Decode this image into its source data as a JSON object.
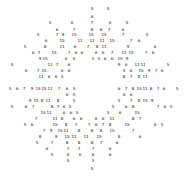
{
  "chart_data": {
    "type": "scatter",
    "title": "",
    "subtitle": "",
    "xlabel": "",
    "ylabel": "",
    "legend": [],
    "legend_position": "none",
    "grid": false,
    "axes_visible": false,
    "tick_labels_x": [],
    "tick_labels_y": [],
    "xlim": [
      0,
      185
    ],
    "ylim": [
      0,
      180
    ],
    "marker_style": "text-number",
    "marker_color": "#111111",
    "background_color": "#ffffff",
    "shape": "annulus",
    "center": [
      92,
      90
    ],
    "inner_radius": 26,
    "outer_radius": 90,
    "value_range": [
      3,
      15
    ],
    "point_count": 268,
    "points": [
      {
        "x": 92,
        "y": 9,
        "v": "5"
      },
      {
        "x": 108,
        "y": 9,
        "v": "5"
      },
      {
        "x": 92,
        "y": 17,
        "v": "6"
      },
      {
        "x": 50,
        "y": 23,
        "v": "5"
      },
      {
        "x": 72,
        "y": 23,
        "v": "6"
      },
      {
        "x": 92,
        "y": 23,
        "v": "7"
      },
      {
        "x": 110,
        "y": 23,
        "v": "6"
      },
      {
        "x": 127,
        "y": 23,
        "v": "5"
      },
      {
        "x": 57,
        "y": 30,
        "v": "6"
      },
      {
        "x": 74,
        "y": 30,
        "v": "7"
      },
      {
        "x": 92,
        "y": 30,
        "v": "8"
      },
      {
        "x": 101,
        "y": 30,
        "v": "8"
      },
      {
        "x": 109,
        "y": 30,
        "v": "7"
      },
      {
        "x": 123,
        "y": 30,
        "v": "6"
      },
      {
        "x": 38,
        "y": 35,
        "v": "5"
      },
      {
        "x": 57,
        "y": 35,
        "v": "7"
      },
      {
        "x": 63,
        "y": 35,
        "v": "9"
      },
      {
        "x": 74,
        "y": 35,
        "v": "15"
      },
      {
        "x": 91,
        "y": 35,
        "v": "15"
      },
      {
        "x": 104,
        "y": 35,
        "v": "15"
      },
      {
        "x": 123,
        "y": 35,
        "v": "7"
      },
      {
        "x": 147,
        "y": 35,
        "v": "5"
      },
      {
        "x": 46,
        "y": 41,
        "v": "6"
      },
      {
        "x": 62,
        "y": 41,
        "v": "15"
      },
      {
        "x": 80,
        "y": 41,
        "v": "11"
      },
      {
        "x": 92,
        "y": 41,
        "v": "11"
      },
      {
        "x": 102,
        "y": 41,
        "v": "11"
      },
      {
        "x": 112,
        "y": 41,
        "v": "15"
      },
      {
        "x": 131,
        "y": 41,
        "v": "7"
      },
      {
        "x": 139,
        "y": 41,
        "v": "6"
      },
      {
        "x": 25,
        "y": 47,
        "v": "5"
      },
      {
        "x": 45,
        "y": 47,
        "v": "8"
      },
      {
        "x": 62,
        "y": 47,
        "v": "11"
      },
      {
        "x": 75,
        "y": 47,
        "v": "6"
      },
      {
        "x": 88,
        "y": 47,
        "v": "7"
      },
      {
        "x": 97,
        "y": 47,
        "v": "8"
      },
      {
        "x": 104,
        "y": 47,
        "v": "11"
      },
      {
        "x": 128,
        "y": 47,
        "v": "9"
      },
      {
        "x": 155,
        "y": 47,
        "v": "6"
      },
      {
        "x": 33,
        "y": 53,
        "v": "6"
      },
      {
        "x": 39,
        "y": 53,
        "v": "7"
      },
      {
        "x": 54,
        "y": 53,
        "v": "15"
      },
      {
        "x": 69,
        "y": 53,
        "v": "7"
      },
      {
        "x": 76,
        "y": 53,
        "v": "6"
      },
      {
        "x": 82,
        "y": 53,
        "v": "6"
      },
      {
        "x": 96,
        "y": 53,
        "v": "6"
      },
      {
        "x": 103,
        "y": 53,
        "v": "6"
      },
      {
        "x": 112,
        "y": 53,
        "v": "7"
      },
      {
        "x": 124,
        "y": 53,
        "v": "11"
      },
      {
        "x": 131,
        "y": 53,
        "v": "15"
      },
      {
        "x": 146,
        "y": 53,
        "v": "7"
      },
      {
        "x": 153,
        "y": 53,
        "v": "6"
      },
      {
        "x": 40,
        "y": 59,
        "v": "9"
      },
      {
        "x": 45,
        "y": 59,
        "v": "15"
      },
      {
        "x": 66,
        "y": 59,
        "v": "6"
      },
      {
        "x": 74,
        "y": 59,
        "v": "5"
      },
      {
        "x": 93,
        "y": 59,
        "v": "5"
      },
      {
        "x": 99,
        "y": 59,
        "v": "5"
      },
      {
        "x": 105,
        "y": 59,
        "v": "6"
      },
      {
        "x": 112,
        "y": 59,
        "v": "6"
      },
      {
        "x": 120,
        "y": 59,
        "v": "15"
      },
      {
        "x": 127,
        "y": 59,
        "v": "9"
      },
      {
        "x": 12,
        "y": 65,
        "v": "5"
      },
      {
        "x": 50,
        "y": 65,
        "v": "11"
      },
      {
        "x": 57,
        "y": 65,
        "v": "7"
      },
      {
        "x": 69,
        "y": 65,
        "v": "6"
      },
      {
        "x": 119,
        "y": 65,
        "v": "9"
      },
      {
        "x": 126,
        "y": 65,
        "v": "6"
      },
      {
        "x": 137,
        "y": 65,
        "v": "11"
      },
      {
        "x": 143,
        "y": 65,
        "v": "11"
      },
      {
        "x": 168,
        "y": 65,
        "v": "5"
      },
      {
        "x": 26,
        "y": 71,
        "v": "6"
      },
      {
        "x": 38,
        "y": 71,
        "v": "7"
      },
      {
        "x": 44,
        "y": 71,
        "v": "15"
      },
      {
        "x": 62,
        "y": 71,
        "v": "6"
      },
      {
        "x": 69,
        "y": 71,
        "v": "6"
      },
      {
        "x": 124,
        "y": 71,
        "v": "5"
      },
      {
        "x": 131,
        "y": 71,
        "v": "6"
      },
      {
        "x": 141,
        "y": 71,
        "v": "15"
      },
      {
        "x": 149,
        "y": 71,
        "v": "9"
      },
      {
        "x": 156,
        "y": 71,
        "v": "7"
      },
      {
        "x": 162,
        "y": 71,
        "v": "6"
      },
      {
        "x": 41,
        "y": 77,
        "v": "11"
      },
      {
        "x": 49,
        "y": 77,
        "v": "6"
      },
      {
        "x": 56,
        "y": 77,
        "v": "6"
      },
      {
        "x": 62,
        "y": 77,
        "v": "5"
      },
      {
        "x": 124,
        "y": 77,
        "v": "8"
      },
      {
        "x": 131,
        "y": 77,
        "v": "7"
      },
      {
        "x": 139,
        "y": 77,
        "v": "8"
      },
      {
        "x": 145,
        "y": 77,
        "v": "11"
      },
      {
        "x": 10,
        "y": 89,
        "v": "5"
      },
      {
        "x": 17,
        "y": 89,
        "v": "6"
      },
      {
        "x": 24,
        "y": 89,
        "v": "7"
      },
      {
        "x": 32,
        "y": 89,
        "v": "9"
      },
      {
        "x": 38,
        "y": 89,
        "v": "15"
      },
      {
        "x": 44,
        "y": 89,
        "v": "15"
      },
      {
        "x": 50,
        "y": 89,
        "v": "11"
      },
      {
        "x": 59,
        "y": 89,
        "v": "7"
      },
      {
        "x": 67,
        "y": 89,
        "v": "6"
      },
      {
        "x": 74,
        "y": 89,
        "v": "5"
      },
      {
        "x": 119,
        "y": 89,
        "v": "6"
      },
      {
        "x": 126,
        "y": 89,
        "v": "7"
      },
      {
        "x": 133,
        "y": 89,
        "v": "8"
      },
      {
        "x": 139,
        "y": 89,
        "v": "15"
      },
      {
        "x": 145,
        "y": 89,
        "v": "11"
      },
      {
        "x": 151,
        "y": 89,
        "v": "8"
      },
      {
        "x": 158,
        "y": 89,
        "v": "7"
      },
      {
        "x": 164,
        "y": 89,
        "v": "6"
      },
      {
        "x": 177,
        "y": 89,
        "v": "5"
      },
      {
        "x": 67,
        "y": 95,
        "v": "6"
      },
      {
        "x": 74,
        "y": 95,
        "v": "5"
      },
      {
        "x": 124,
        "y": 95,
        "v": "6"
      },
      {
        "x": 131,
        "y": 95,
        "v": "6"
      },
      {
        "x": 30,
        "y": 101,
        "v": "9"
      },
      {
        "x": 36,
        "y": 101,
        "v": "15"
      },
      {
        "x": 42,
        "y": 101,
        "v": "8"
      },
      {
        "x": 48,
        "y": 101,
        "v": "11"
      },
      {
        "x": 58,
        "y": 101,
        "v": "8"
      },
      {
        "x": 74,
        "y": 101,
        "v": "5"
      },
      {
        "x": 119,
        "y": 101,
        "v": "5"
      },
      {
        "x": 131,
        "y": 101,
        "v": "7"
      },
      {
        "x": 139,
        "y": 101,
        "v": "8"
      },
      {
        "x": 145,
        "y": 101,
        "v": "15"
      },
      {
        "x": 152,
        "y": 101,
        "v": "9"
      },
      {
        "x": 12,
        "y": 107,
        "v": "5"
      },
      {
        "x": 26,
        "y": 107,
        "v": "6"
      },
      {
        "x": 33,
        "y": 107,
        "v": "7"
      },
      {
        "x": 52,
        "y": 107,
        "v": "8"
      },
      {
        "x": 58,
        "y": 107,
        "v": "7"
      },
      {
        "x": 64,
        "y": 107,
        "v": "6"
      },
      {
        "x": 70,
        "y": 107,
        "v": "5"
      },
      {
        "x": 113,
        "y": 107,
        "v": "5"
      },
      {
        "x": 126,
        "y": 107,
        "v": "6"
      },
      {
        "x": 133,
        "y": 107,
        "v": "8"
      },
      {
        "x": 158,
        "y": 107,
        "v": "7"
      },
      {
        "x": 165,
        "y": 107,
        "v": "6"
      },
      {
        "x": 171,
        "y": 107,
        "v": "5"
      },
      {
        "x": 43,
        "y": 113,
        "v": "15"
      },
      {
        "x": 49,
        "y": 113,
        "v": "11"
      },
      {
        "x": 64,
        "y": 113,
        "v": "6"
      },
      {
        "x": 71,
        "y": 113,
        "v": "6"
      },
      {
        "x": 77,
        "y": 113,
        "v": "5"
      },
      {
        "x": 108,
        "y": 113,
        "v": "5"
      },
      {
        "x": 120,
        "y": 113,
        "v": "6"
      },
      {
        "x": 137,
        "y": 113,
        "v": "15"
      },
      {
        "x": 36,
        "y": 119,
        "v": "7"
      },
      {
        "x": 55,
        "y": 119,
        "v": "11"
      },
      {
        "x": 62,
        "y": 119,
        "v": "8"
      },
      {
        "x": 74,
        "y": 119,
        "v": "6"
      },
      {
        "x": 81,
        "y": 119,
        "v": "6"
      },
      {
        "x": 96,
        "y": 119,
        "v": "6"
      },
      {
        "x": 103,
        "y": 119,
        "v": "6"
      },
      {
        "x": 112,
        "y": 119,
        "v": "11"
      },
      {
        "x": 133,
        "y": 119,
        "v": "8"
      },
      {
        "x": 140,
        "y": 119,
        "v": "7"
      },
      {
        "x": 25,
        "y": 125,
        "v": "5"
      },
      {
        "x": 32,
        "y": 125,
        "v": "6"
      },
      {
        "x": 55,
        "y": 125,
        "v": "15"
      },
      {
        "x": 66,
        "y": 125,
        "v": "8"
      },
      {
        "x": 76,
        "y": 125,
        "v": "7"
      },
      {
        "x": 89,
        "y": 125,
        "v": "7"
      },
      {
        "x": 96,
        "y": 125,
        "v": "6"
      },
      {
        "x": 103,
        "y": 125,
        "v": "7"
      },
      {
        "x": 110,
        "y": 125,
        "v": "8"
      },
      {
        "x": 127,
        "y": 125,
        "v": "15"
      },
      {
        "x": 155,
        "y": 125,
        "v": "6"
      },
      {
        "x": 162,
        "y": 125,
        "v": "5"
      },
      {
        "x": 44,
        "y": 131,
        "v": "7"
      },
      {
        "x": 51,
        "y": 131,
        "v": "9"
      },
      {
        "x": 60,
        "y": 131,
        "v": "15"
      },
      {
        "x": 66,
        "y": 131,
        "v": "11"
      },
      {
        "x": 79,
        "y": 131,
        "v": "8"
      },
      {
        "x": 92,
        "y": 131,
        "v": "8"
      },
      {
        "x": 101,
        "y": 131,
        "v": "8"
      },
      {
        "x": 112,
        "y": 131,
        "v": "15"
      },
      {
        "x": 133,
        "y": 131,
        "v": "7"
      },
      {
        "x": 40,
        "y": 137,
        "v": "8"
      },
      {
        "x": 56,
        "y": 137,
        "v": "9"
      },
      {
        "x": 67,
        "y": 137,
        "v": "15"
      },
      {
        "x": 74,
        "y": 137,
        "v": "11"
      },
      {
        "x": 86,
        "y": 137,
        "v": "11"
      },
      {
        "x": 99,
        "y": 137,
        "v": "15"
      },
      {
        "x": 119,
        "y": 137,
        "v": "8"
      },
      {
        "x": 140,
        "y": 137,
        "v": "6"
      },
      {
        "x": 37,
        "y": 143,
        "v": "5"
      },
      {
        "x": 52,
        "y": 143,
        "v": "7"
      },
      {
        "x": 67,
        "y": 143,
        "v": "8"
      },
      {
        "x": 79,
        "y": 143,
        "v": "8"
      },
      {
        "x": 92,
        "y": 143,
        "v": "8"
      },
      {
        "x": 101,
        "y": 143,
        "v": "7"
      },
      {
        "x": 117,
        "y": 143,
        "v": "6"
      },
      {
        "x": 47,
        "y": 149,
        "v": "6"
      },
      {
        "x": 68,
        "y": 149,
        "v": "7"
      },
      {
        "x": 79,
        "y": 149,
        "v": "7"
      },
      {
        "x": 93,
        "y": 149,
        "v": "7"
      },
      {
        "x": 110,
        "y": 149,
        "v": "6"
      },
      {
        "x": 52,
        "y": 155,
        "v": "5"
      },
      {
        "x": 68,
        "y": 155,
        "v": "6"
      },
      {
        "x": 80,
        "y": 155,
        "v": "6"
      },
      {
        "x": 93,
        "y": 155,
        "v": "6"
      },
      {
        "x": 110,
        "y": 155,
        "v": "6"
      },
      {
        "x": 68,
        "y": 161,
        "v": "5"
      },
      {
        "x": 93,
        "y": 161,
        "v": "5"
      },
      {
        "x": 92,
        "y": 169,
        "v": "5"
      }
    ]
  }
}
